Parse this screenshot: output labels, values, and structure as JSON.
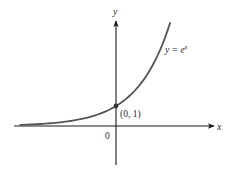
{
  "figure": {
    "function_label_prefix": "y = e",
    "function_label_exponent": "x",
    "x_axis_label": "x",
    "y_axis_label": "y",
    "origin_label": "0",
    "point_label": "(0, 1)",
    "colors": {
      "axis": "#1a1a1a",
      "curve": "#555555",
      "point": "#333333",
      "text": "#2a2a2a"
    }
  },
  "chart_data": {
    "type": "line",
    "title": "",
    "xlabel": "x",
    "ylabel": "y",
    "series": [
      {
        "name": "y = e^x",
        "x": [
          -2.9,
          -2.5,
          -2.0,
          -1.5,
          -1.0,
          -0.5,
          0.0,
          0.5,
          1.0,
          1.5,
          1.64
        ],
        "values": [
          0.055,
          0.082,
          0.135,
          0.223,
          0.368,
          0.607,
          1.0,
          1.649,
          2.718,
          4.482,
          5.16
        ]
      }
    ],
    "highlighted_point": {
      "x": 0,
      "y": 1,
      "label": "(0, 1)"
    },
    "xlim": [
      -3.1,
      2.9
    ],
    "ylim": [
      -1.95,
      5.2
    ],
    "ticks": {
      "x": [
        "0"
      ],
      "y": []
    },
    "grid": false,
    "legend": "none"
  }
}
